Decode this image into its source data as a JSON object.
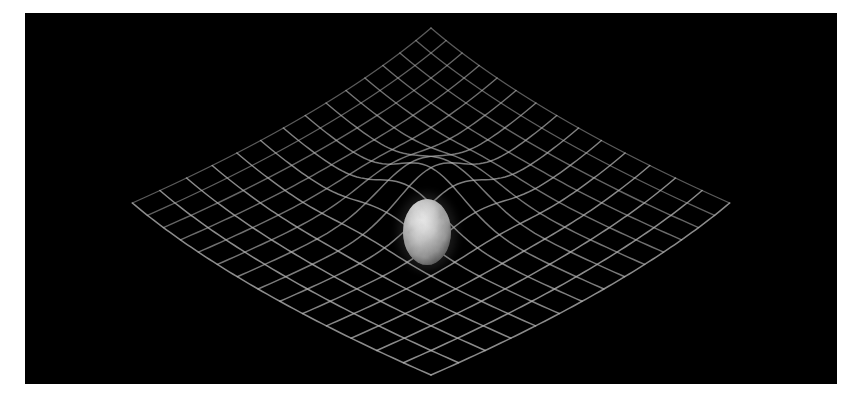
{
  "figure": {
    "title": "Spacetime curvature around a planetary mass",
    "canvas": {
      "width": 859,
      "height": 406,
      "background": "#ffffff"
    },
    "panel": {
      "name": "spacetime-scene",
      "x": 25,
      "y": 13,
      "width": 812,
      "height": 371,
      "background": "#000000"
    }
  },
  "chart_data": {
    "type": "scatter",
    "title": "Spacetime curvature around a planetary mass",
    "subtitle": "Gravity well deformation of a 2D embedding grid",
    "xlabel": "",
    "ylabel": "",
    "grid": true,
    "legend_position": "none",
    "annotations": [],
    "mesh": {
      "description": "Square mesh rendered in perspective, rotated 45 degrees so cells read as diamonds, warped downward by a central point mass",
      "divisions_u": 14,
      "divisions_v": 14,
      "half_extent": 7.0,
      "line_color": "#b4b4b4",
      "line_color_dim": "#5a5a5a",
      "line_width_px": 1.6,
      "top_apex": {
        "x": 406,
        "y": 15
      },
      "bottom_apex": {
        "x": 406,
        "y": 362
      },
      "left_apex": {
        "x": 14,
        "y": 190
      },
      "right_apex": {
        "x": 800,
        "y": 190
      }
    },
    "well": {
      "description": "Central gravitational depression; grid sags toward the mass",
      "center_x": 406,
      "center_y": 205,
      "depth": 1.55,
      "width_sigma": 1.5
    },
    "body": {
      "name": "planet",
      "label": "Earth",
      "center_x": 402,
      "center_y": 219,
      "radius_x": 24,
      "radius_y": 33,
      "palette": [
        "#0d0d0d",
        "#5b5b5b",
        "#8f8f8f",
        "#c8c8c8",
        "#efefef"
      ],
      "surface": "mottled grayscale continents and cloud patches"
    }
  },
  "colors": {
    "background": "#ffffff",
    "panel": "#000000",
    "grid_line": "#b4b4b4",
    "grid_line_dim": "#5a5a5a",
    "body_light": "#e8e8e8",
    "body_mid": "#9a9a9a",
    "body_dark": "#2a2a2a"
  }
}
